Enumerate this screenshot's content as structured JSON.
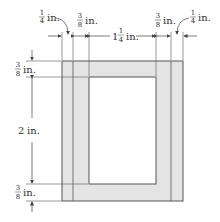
{
  "diagram": {
    "type": "dimensioned-frame-cross-section",
    "colors": {
      "frame_fill": "#e4e4e4",
      "frame_stroke": "#555555",
      "window_fill": "#ffffff",
      "dim_line": "#444444"
    },
    "top_dimensions": [
      {
        "id": "left-outer",
        "whole": "",
        "num": "1",
        "den": "4",
        "unit": "in."
      },
      {
        "id": "left-inner",
        "whole": "",
        "num": "3",
        "den": "8",
        "unit": "in."
      },
      {
        "id": "center",
        "whole": "1",
        "num": "1",
        "den": "4",
        "unit": "in."
      },
      {
        "id": "right-inner",
        "whole": "",
        "num": "3",
        "den": "8",
        "unit": "in."
      },
      {
        "id": "right-outer",
        "whole": "",
        "num": "1",
        "den": "4",
        "unit": "in."
      }
    ],
    "left_dimensions": [
      {
        "id": "top",
        "whole": "",
        "num": "3",
        "den": "8",
        "unit": "in."
      },
      {
        "id": "middle",
        "whole": "2",
        "num": "",
        "den": "",
        "unit": "in."
      },
      {
        "id": "bottom",
        "whole": "",
        "num": "3",
        "den": "8",
        "unit": "in."
      }
    ]
  }
}
